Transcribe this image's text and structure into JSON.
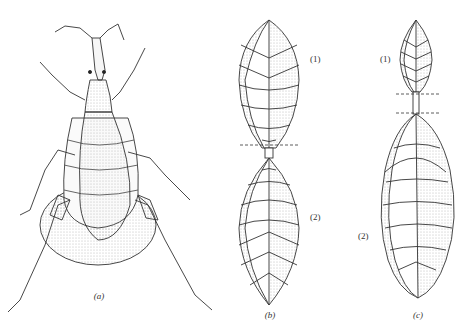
{
  "figure": {
    "panels": [
      {
        "id": "a",
        "label": "(a)",
        "description": "Dorsal view of insect (weevil-like) with elongated rostrum, antennae, legs and large abdomen"
      },
      {
        "id": "b",
        "label": "(b)",
        "parts": [
          {
            "label": "(1)"
          },
          {
            "label": "(2)"
          }
        ],
        "description": "Two equal fusiform segments joined by narrow petiole, dashed line at junction"
      },
      {
        "id": "c",
        "label": "(c)",
        "parts": [
          {
            "label": "(1)"
          },
          {
            "label": "(2)"
          }
        ],
        "description": "Small upper fusiform segment, petiole between two dashed lines, large lower segment"
      }
    ]
  }
}
